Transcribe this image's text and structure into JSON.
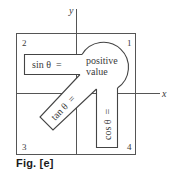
{
  "figure": {
    "caption": "Fig. [e]",
    "axes": {
      "x_label": "x",
      "y_label": "y"
    },
    "quadrants": [
      {
        "id": "q1",
        "label": "1"
      },
      {
        "id": "q2",
        "label": "2"
      },
      {
        "id": "q3",
        "label": "3"
      },
      {
        "id": "q4",
        "label": "4"
      }
    ],
    "hub": {
      "line1": "positive",
      "line2": "value"
    },
    "arms": {
      "sin": "sin θ  =",
      "tan": "tan θ  =",
      "cos": "cos θ  ="
    },
    "colors": {
      "stroke": "#4a4a4a",
      "text": "#3a3a3a",
      "background": "#ffffff"
    }
  }
}
